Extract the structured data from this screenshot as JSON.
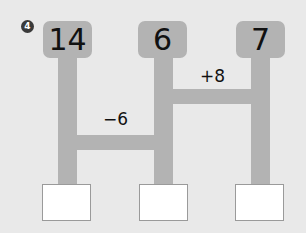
{
  "problem": {
    "number": "4",
    "top_numbers": [
      "14",
      "6",
      "7"
    ],
    "operations": [
      {
        "label": "−6",
        "connects": [
          "14",
          "6"
        ]
      },
      {
        "label": "+8",
        "connects": [
          "6",
          "7"
        ]
      }
    ],
    "answer_boxes": [
      "",
      "",
      ""
    ]
  },
  "colors": {
    "background": "#e9e9e9",
    "pipe": "#b3b3b3",
    "answer_box": "#ffffff",
    "text": "#111111"
  }
}
